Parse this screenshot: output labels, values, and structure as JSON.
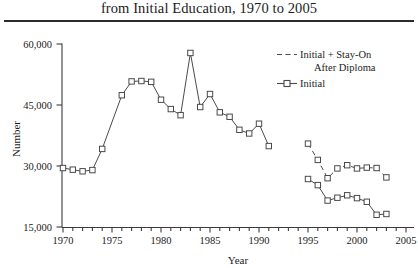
{
  "title": {
    "text": "from Initial Education, 1970 to 2005"
  },
  "axes": {
    "y_label": "Number",
    "x_label": "Year",
    "y_ticks": [
      "15,000",
      "30,000",
      "45,000",
      "60,000"
    ],
    "x_ticks": [
      "1970",
      "1975",
      "1980",
      "1985",
      "1990",
      "1995",
      "2000",
      "2005"
    ]
  },
  "legend": {
    "entry_1_label": "Initial + Stay-On",
    "entry_1_label_cont": "After Diploma",
    "entry_1_sample": "dashed-line-sample",
    "entry_2_label": "Initial",
    "entry_2_sample": "line-with-square-marker-sample"
  },
  "colors": {
    "line": "#4a4a4a",
    "marker_fill": "#ffffff",
    "axis": "#3c3c3c",
    "text": "#1c1c1c",
    "rule": "#2b2b2b"
  },
  "chart_data": {
    "type": "line",
    "title": "from Initial Education, 1970 to 2005",
    "xlabel": "Year",
    "ylabel": "Number",
    "xlim": [
      1970,
      2005
    ],
    "ylim": [
      15000,
      60000
    ],
    "yticks": [
      15000,
      30000,
      45000,
      60000
    ],
    "xticks": [
      1970,
      1975,
      1980,
      1985,
      1990,
      1995,
      2000,
      2005
    ],
    "grid": false,
    "legend_position": "top-right",
    "series": [
      {
        "name": "Initial",
        "style": "solid-with-open-square-markers",
        "segments": [
          {
            "x": [
              1970,
              1971,
              1972,
              1973,
              1974,
              1976,
              1977,
              1978,
              1979,
              1980,
              1981,
              1982,
              1983,
              1984,
              1985,
              1986,
              1987,
              1988,
              1989,
              1990,
              1991
            ],
            "y": [
              29500,
              29100,
              28700,
              29000,
              34200,
              47400,
              50800,
              50900,
              50700,
              46300,
              44000,
              42500,
              57800,
              44500,
              47700,
              43200,
              42100,
              38900,
              38000,
              40400,
              34900
            ]
          },
          {
            "x": [
              1995,
              1996,
              1997,
              1998,
              1999,
              2000,
              2001,
              2002,
              2003
            ],
            "y": [
              26800,
              25300,
              21500,
              22200,
              22800,
              22100,
              21200,
              18000,
              18200
            ]
          }
        ]
      },
      {
        "name": "Initial + Stay-On After Diploma",
        "style": "dashed-no-markers",
        "segments": [
          {
            "x": [
              1995,
              1996,
              1997,
              1998,
              1999,
              2000,
              2001,
              2002,
              2003
            ],
            "y": [
              35500,
              31500,
              27000,
              29400,
              30200,
              29400,
              29600,
              29500,
              27200
            ]
          }
        ]
      }
    ]
  }
}
